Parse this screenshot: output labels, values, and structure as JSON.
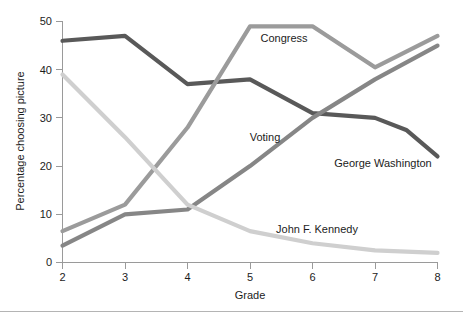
{
  "chart_data": {
    "type": "line",
    "title": "",
    "subtitle": "",
    "xlabel": "Grade",
    "ylabel": "Percentage choosing picture",
    "x": [
      2,
      3,
      4,
      5,
      6,
      7,
      8
    ],
    "xtick_labels": [
      "2",
      "3",
      "4",
      "5",
      "6",
      "7",
      "8"
    ],
    "ytick_labels": [
      "0",
      "10",
      "20",
      "30",
      "40",
      "50"
    ],
    "yticks": [
      0,
      10,
      20,
      30,
      40,
      50
    ],
    "xlim": [
      2,
      8
    ],
    "ylim": [
      0,
      50
    ],
    "grid": false,
    "legend_position": "inline-annotations",
    "series": [
      {
        "name": "George Washington",
        "color": "#595959",
        "values": [
          46,
          47,
          37,
          38,
          31,
          30,
          27.5,
          22
        ],
        "x_values": [
          2,
          3,
          4,
          5,
          6,
          7,
          7.5,
          8
        ],
        "label": "George Washington",
        "label_x": 383,
        "label_y": 167
      },
      {
        "name": "Congress",
        "color": "#9b9b9b",
        "values": [
          6.5,
          12,
          28,
          49,
          49,
          40.5,
          47
        ],
        "x_values": [
          2,
          3,
          4,
          5,
          6,
          7,
          8
        ],
        "label": "Congress",
        "label_x": 284,
        "label_y": 42
      },
      {
        "name": "Voting",
        "color": "#868686",
        "values": [
          3.5,
          10,
          11,
          20,
          30,
          38,
          45
        ],
        "x_values": [
          2,
          3,
          4,
          5,
          6,
          7,
          8
        ],
        "label": "Voting",
        "label_x": 265,
        "label_y": 141
      },
      {
        "name": "John F. Kennedy",
        "color": "#cfcfcf",
        "values": [
          39,
          26,
          12,
          6.5,
          4,
          2.5,
          2
        ],
        "x_values": [
          2,
          3,
          4,
          5,
          6,
          7,
          8
        ],
        "label": "John F. Kennedy",
        "label_x": 317,
        "label_y": 233
      }
    ]
  },
  "axes": {
    "y_title": "Percentage choosing picture",
    "x_title": "Grade",
    "y_tick_0": "0",
    "y_tick_1": "10",
    "y_tick_2": "20",
    "y_tick_3": "30",
    "y_tick_4": "40",
    "y_tick_5": "50",
    "x_tick_0": "2",
    "x_tick_1": "3",
    "x_tick_2": "4",
    "x_tick_3": "5",
    "x_tick_4": "6",
    "x_tick_5": "7",
    "x_tick_6": "8"
  },
  "colors": {
    "background": "#ffffff",
    "axis": "#9a9a9a",
    "text": "#1c1c1c",
    "footer_rule": "#b4b4b4"
  }
}
